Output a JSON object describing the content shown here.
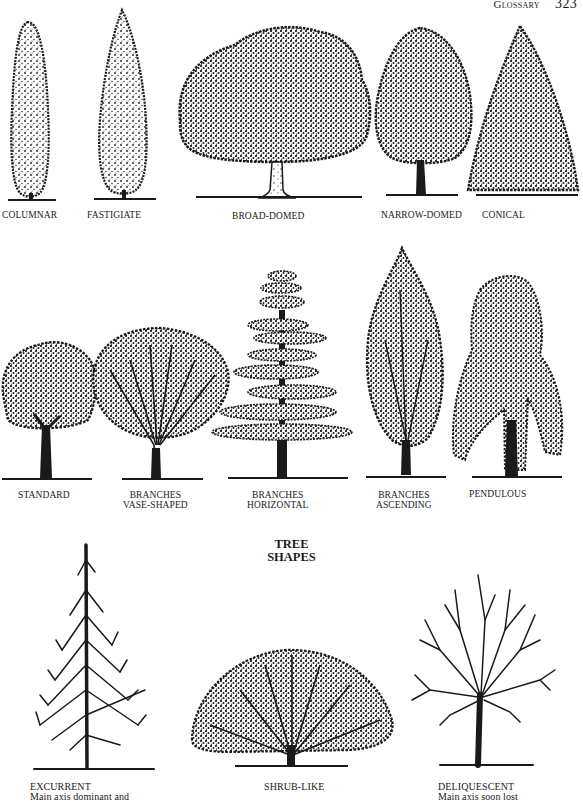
{
  "running_head": {
    "section": "Glossary",
    "page_number": "323"
  },
  "figure_title": {
    "line1": "TREE",
    "line2": "SHAPES"
  },
  "row1": [
    {
      "id": "columnar",
      "label": "COLUMNAR"
    },
    {
      "id": "fastigiate",
      "label": "FASTIGIATE"
    },
    {
      "id": "broad-domed",
      "label": "BROAD-DOMED"
    },
    {
      "id": "narrow-domed",
      "label": "NARROW-DOMED"
    },
    {
      "id": "conical",
      "label": "CONICAL"
    }
  ],
  "row2": [
    {
      "id": "standard",
      "label": "STANDARD"
    },
    {
      "id": "branches-vase-shaped",
      "label_line1": "BRANCHES",
      "label_line2": "VASE-SHAPED"
    },
    {
      "id": "branches-horizontal",
      "label_line1": "BRANCHES",
      "label_line2": "HORIZONTAL"
    },
    {
      "id": "branches-ascending",
      "label_line1": "BRANCHES",
      "label_line2": "ASCENDING"
    },
    {
      "id": "pendulous",
      "label": "PENDULOUS"
    }
  ],
  "row3": [
    {
      "id": "excurrent",
      "label": "EXCURRENT",
      "caption": "Main axis dominant and"
    },
    {
      "id": "shrub-like",
      "label": "SHRUB-LIKE"
    },
    {
      "id": "deliquescent",
      "label": "DELIQUESCENT",
      "caption": "Main axis soon lost"
    }
  ],
  "colors": {
    "ink": "#1a1a1a",
    "paper": "#ffffff"
  }
}
